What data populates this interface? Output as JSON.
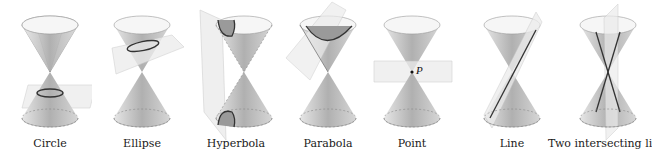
{
  "figure": {
    "panels": [
      {
        "id": "circle",
        "label": "Circle",
        "x": 28
      },
      {
        "id": "ellipse",
        "label": "Ellipse",
        "x": 117
      },
      {
        "id": "hyperbola",
        "label": "Hyperbola",
        "x": 205
      },
      {
        "id": "parabola",
        "label": "Parabola",
        "x": 295
      },
      {
        "id": "point",
        "label": "Point",
        "x": 384,
        "point_label": "P"
      },
      {
        "id": "line",
        "label": "Line",
        "x": 474
      },
      {
        "id": "two-lines",
        "label": "Two intersecting lines",
        "x": 562
      }
    ]
  },
  "colors": {
    "cone_fill_top": "#c9c9c9",
    "cone_fill_dark": "#a8a8a8",
    "rim_fill": "#f4f4f4",
    "plane_fill": "#e8e8e8",
    "plane_stroke": "#bdbdbd",
    "curve_stroke": "#333333",
    "text": "#1a1a1a"
  }
}
